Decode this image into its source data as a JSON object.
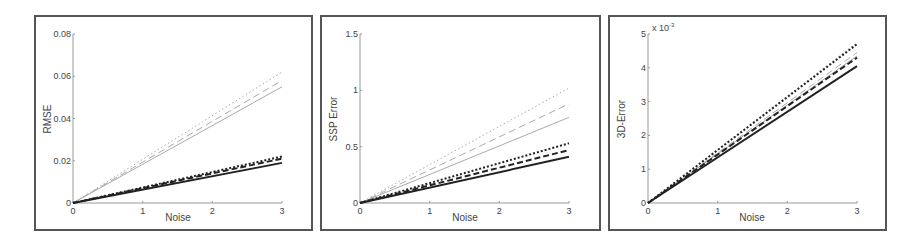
{
  "chart_data": [
    {
      "type": "line",
      "title": "",
      "xlabel": "Noise",
      "ylabel": "RMSE",
      "xlim": [
        0,
        3
      ],
      "ylim": [
        0,
        0.08
      ],
      "xticks": [
        "0",
        "1",
        "2",
        "3"
      ],
      "yticks": [
        "0",
        "0.02",
        "0.04",
        "0.06",
        "0.08"
      ],
      "grid": false,
      "legend": null,
      "x": [
        0,
        3
      ],
      "series": [
        {
          "name": "gray dotted",
          "color": "#aaaaaa",
          "style": "dotted",
          "width": 1,
          "values": [
            0,
            0.062
          ]
        },
        {
          "name": "gray dashed",
          "color": "#aaaaaa",
          "style": "dashed",
          "width": 1,
          "values": [
            0,
            0.058
          ]
        },
        {
          "name": "gray solid",
          "color": "#aaaaaa",
          "style": "solid",
          "width": 1,
          "values": [
            0,
            0.055
          ]
        },
        {
          "name": "black dotted",
          "color": "#222222",
          "style": "dotted",
          "width": 2,
          "values": [
            0,
            0.022
          ]
        },
        {
          "name": "black dashed",
          "color": "#222222",
          "style": "dashed",
          "width": 2,
          "values": [
            0,
            0.021
          ]
        },
        {
          "name": "black solid",
          "color": "#222222",
          "style": "solid",
          "width": 2,
          "values": [
            0,
            0.019
          ]
        }
      ]
    },
    {
      "type": "line",
      "title": "",
      "xlabel": "Noise",
      "ylabel": "SSP Error",
      "xlim": [
        0,
        3
      ],
      "ylim": [
        0,
        1.5
      ],
      "xticks": [
        "0",
        "1",
        "2",
        "3"
      ],
      "yticks": [
        "0",
        "0.5",
        "1",
        "1.5"
      ],
      "grid": false,
      "legend": null,
      "x": [
        0,
        3
      ],
      "series": [
        {
          "name": "gray dotted",
          "color": "#aaaaaa",
          "style": "dotted",
          "width": 1,
          "values": [
            0,
            1.02
          ]
        },
        {
          "name": "gray dashed",
          "color": "#aaaaaa",
          "style": "dashed",
          "width": 1,
          "values": [
            0,
            0.88
          ]
        },
        {
          "name": "gray solid",
          "color": "#aaaaaa",
          "style": "solid",
          "width": 1,
          "values": [
            0,
            0.76
          ]
        },
        {
          "name": "black dotted",
          "color": "#222222",
          "style": "dotted",
          "width": 2,
          "values": [
            0,
            0.53
          ]
        },
        {
          "name": "black dashed",
          "color": "#222222",
          "style": "dashed",
          "width": 2,
          "values": [
            0,
            0.47
          ]
        },
        {
          "name": "black solid",
          "color": "#222222",
          "style": "solid",
          "width": 2,
          "values": [
            0,
            0.41
          ]
        }
      ]
    },
    {
      "type": "line",
      "title": "",
      "xlabel": "Noise",
      "ylabel": "3D-Error",
      "y_exponent_label": "x 10^-3",
      "xlim": [
        0,
        3
      ],
      "ylim": [
        0,
        5
      ],
      "xticks": [
        "0",
        "1",
        "2",
        "3"
      ],
      "yticks": [
        "0",
        "1",
        "2",
        "3",
        "4",
        "5"
      ],
      "grid": false,
      "legend": null,
      "x": [
        0,
        3
      ],
      "series": [
        {
          "name": "gray dotted",
          "color": "#aaaaaa",
          "style": "dotted",
          "width": 1,
          "values": [
            0,
            4.75
          ]
        },
        {
          "name": "gray dashed",
          "color": "#aaaaaa",
          "style": "dashed",
          "width": 1,
          "values": [
            0,
            4.45
          ]
        },
        {
          "name": "gray solid",
          "color": "#aaaaaa",
          "style": "solid",
          "width": 1,
          "values": [
            0,
            4.35
          ]
        },
        {
          "name": "black dotted",
          "color": "#222222",
          "style": "dotted",
          "width": 2,
          "values": [
            0,
            4.7
          ]
        },
        {
          "name": "black dashed",
          "color": "#222222",
          "style": "dashed",
          "width": 2,
          "values": [
            0,
            4.3
          ]
        },
        {
          "name": "black solid",
          "color": "#222222",
          "style": "solid",
          "width": 2,
          "values": [
            0,
            4.05
          ]
        }
      ]
    }
  ],
  "panels": [
    {
      "ylabel": "RMSE",
      "xlabel": "Noise"
    },
    {
      "ylabel": "SSP Error",
      "xlabel": "Noise"
    },
    {
      "ylabel": "3D-Error",
      "xlabel": "Noise",
      "exponent_base": "x 10",
      "exponent_power": "-3"
    }
  ]
}
